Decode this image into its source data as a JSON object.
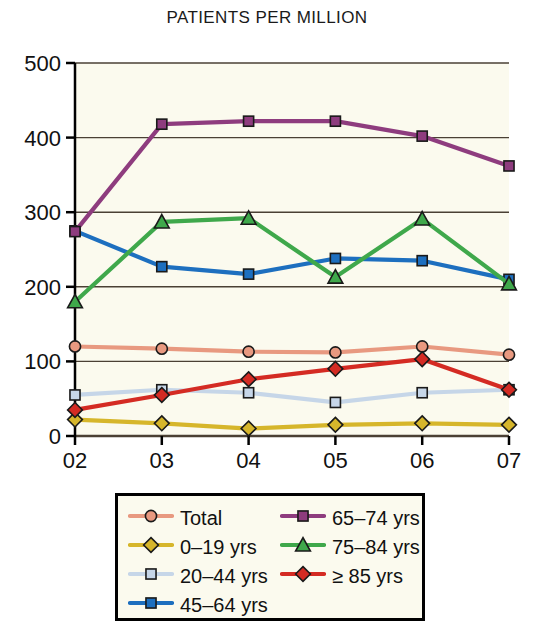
{
  "chart_data": {
    "type": "line",
    "title": "PATIENTS PER MILLION",
    "xlabel": "",
    "ylabel": "",
    "categories": [
      "02",
      "03",
      "04",
      "05",
      "06",
      "07"
    ],
    "x_tick_labels": [
      "02",
      "03",
      "04",
      "05",
      "06",
      "07"
    ],
    "y_tick_labels": [
      "0",
      "100",
      "200",
      "300",
      "400",
      "500"
    ],
    "ylim": [
      0,
      500
    ],
    "y_ticks": [
      0,
      100,
      200,
      300,
      400,
      500
    ],
    "grid": "horizontal",
    "legend_position": "bottom",
    "series": [
      {
        "name": "Total",
        "color": "#E89980",
        "marker": "circle",
        "values": [
          120,
          117,
          113,
          112,
          120,
          109
        ]
      },
      {
        "name": "0–19 yrs",
        "color": "#D6B62B",
        "marker": "diamond",
        "values": [
          22,
          17,
          10,
          15,
          17,
          15
        ]
      },
      {
        "name": "20–44 yrs",
        "color": "#C6D6E8",
        "marker": "square",
        "values": [
          55,
          62,
          58,
          45,
          58,
          62
        ]
      },
      {
        "name": "45–64 yrs",
        "color": "#1D6FBF",
        "marker": "square",
        "values": [
          275,
          227,
          217,
          238,
          235,
          210
        ]
      },
      {
        "name": "65–74 yrs",
        "color": "#8E3C7E",
        "marker": "square",
        "values": [
          274,
          418,
          422,
          422,
          402,
          362
        ]
      },
      {
        "name": "75–84 yrs",
        "color": "#3FA84B",
        "marker": "triangle",
        "values": [
          180,
          287,
          292,
          213,
          291,
          204
        ]
      },
      {
        "name": "≥ 85 yrs",
        "color": "#D42B23",
        "marker": "diamond",
        "values": [
          35,
          55,
          76,
          90,
          103,
          62
        ]
      }
    ]
  },
  "legend": {
    "entries": [
      {
        "label": "Total",
        "color": "#E89980",
        "marker": "circle"
      },
      {
        "label": "65–74 yrs",
        "color": "#8E3C7E",
        "marker": "square"
      },
      {
        "label": "0–19 yrs",
        "color": "#D6B62B",
        "marker": "diamond"
      },
      {
        "label": "75–84 yrs",
        "color": "#3FA84B",
        "marker": "triangle"
      },
      {
        "label": "20–44 yrs",
        "color": "#C6D6E8",
        "marker": "square"
      },
      {
        "label": "≥ 85 yrs",
        "color": "#D42B23",
        "marker": "diamond"
      },
      {
        "label": "45–64 yrs",
        "color": "#1D6FBF",
        "marker": "square"
      },
      {
        "label": "",
        "color": "",
        "marker": "none"
      }
    ]
  },
  "colors": {
    "plot_background": "#FBFAEE",
    "axis": "#000000",
    "gridline": "#4a4034",
    "page_background": "#FFFFFF"
  }
}
